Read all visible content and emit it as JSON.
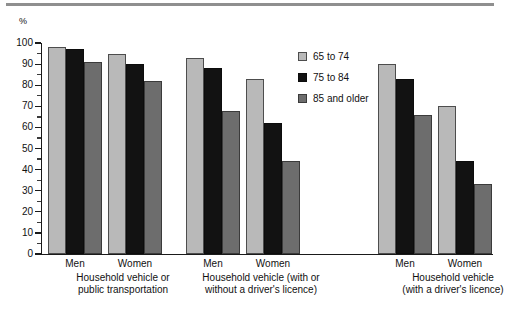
{
  "chart_data": {
    "type": "bar",
    "title": "",
    "subtitle": "",
    "xlabel": "",
    "ylabel": "%",
    "ylim": [
      0,
      100
    ],
    "yticks": [
      0,
      10,
      20,
      30,
      40,
      50,
      60,
      70,
      80,
      90,
      100
    ],
    "ytick_labels": [
      "0",
      "10",
      "20",
      "30",
      "40",
      "50",
      "60",
      "70",
      "80",
      "90",
      "100"
    ],
    "grid": false,
    "legend_position": "upper-center-right",
    "categories": [
      "Men",
      "Women",
      "Men",
      "Women",
      "Men",
      "Women"
    ],
    "groups": [
      {
        "label_line1": "Household vehicle or",
        "label_line2": "public transportation",
        "categories": [
          {
            "name": "Men",
            "values": [
              98,
              97,
              91
            ]
          },
          {
            "name": "Women",
            "values": [
              95,
              90,
              82
            ]
          }
        ]
      },
      {
        "label_line1": "Household vehicle (with or",
        "label_line2": "without a driver's licence)",
        "categories": [
          {
            "name": "Men",
            "values": [
              93,
              88,
              68
            ]
          },
          {
            "name": "Women",
            "values": [
              83,
              62,
              44
            ]
          }
        ]
      },
      {
        "label_line1": "Household vehicle",
        "label_line2": "(with a driver's licence)",
        "categories": [
          {
            "name": "Men",
            "values": [
              90,
              83,
              66
            ]
          },
          {
            "name": "Women",
            "values": [
              70,
              44,
              33
            ]
          }
        ]
      }
    ],
    "series": [
      {
        "name": "65 to 74",
        "color": "#b9b9b9",
        "values": [
          98,
          95,
          93,
          83,
          90,
          70
        ]
      },
      {
        "name": "75 to 84",
        "color": "#121212",
        "values": [
          97,
          90,
          88,
          62,
          83,
          44
        ]
      },
      {
        "name": "85 and older",
        "color": "#6d6d6d",
        "values": [
          91,
          82,
          68,
          44,
          66,
          33
        ]
      }
    ]
  },
  "legend": {
    "items": [
      {
        "label": "65 to 74"
      },
      {
        "label": "75 to 84"
      },
      {
        "label": "85 and older"
      }
    ]
  },
  "axis": {
    "unit": "%"
  },
  "colors": {
    "series_65_74": "#b9b9b9",
    "series_75_84": "#121212",
    "series_85_plus": "#6d6d6d",
    "axis": "#1a1a1a",
    "rule": "#8f8f8f",
    "text": "#111111"
  }
}
